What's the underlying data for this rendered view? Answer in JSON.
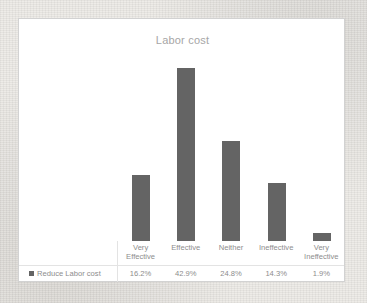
{
  "chart_data": {
    "type": "bar",
    "title": "Labor cost",
    "xlabel": "",
    "ylabel": "",
    "categories": [
      "Very Effective",
      "Effective",
      "Neither",
      "Ineffective",
      "Very Ineffective"
    ],
    "series": [
      {
        "name": "Reduce Labor cost",
        "values": [
          16.2,
          42.9,
          24.8,
          14.3,
          1.9
        ],
        "value_labels": [
          "16.2%",
          "42.9%",
          "24.8%",
          "14.3%",
          "1.9%"
        ]
      }
    ],
    "ylim": [
      0,
      45
    ],
    "grid": false,
    "legend_position": "bottom-left-data-table",
    "bar_color": "#646464"
  },
  "chart": {
    "title": "Labor cost",
    "legend_label": "Reduce Labor cost",
    "categories": [
      {
        "line1": "Very",
        "line2": "Effective"
      },
      {
        "line1": "Effective",
        "line2": ""
      },
      {
        "line1": "Neither",
        "line2": ""
      },
      {
        "line1": "Ineffective",
        "line2": ""
      },
      {
        "line1": "Very",
        "line2": "Ineffective"
      }
    ],
    "values": [
      "16.2%",
      "42.9%",
      "24.8%",
      "14.3%",
      "1.9%"
    ],
    "colors": {
      "bar": "#646464",
      "title_text": "#a6a6a6",
      "table_text": "#8d8d8d",
      "frame_border": "#d2d2d2",
      "plot_background": "#ffffff",
      "page_background": "#eceae6"
    }
  }
}
